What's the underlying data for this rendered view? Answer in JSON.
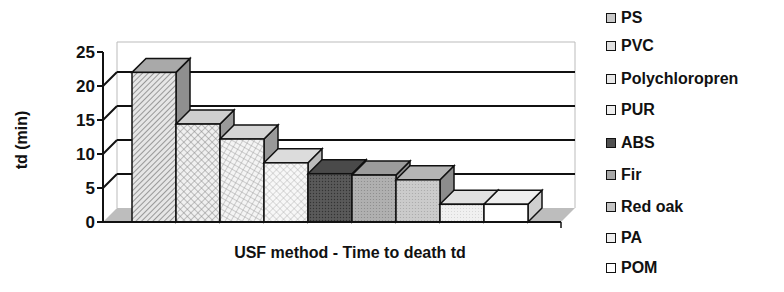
{
  "chart_data": {
    "type": "bar",
    "style": "3d-column",
    "title": "",
    "xlabel": "USF method - Time to death td",
    "ylabel": "td (min)",
    "ylim": [
      0,
      25
    ],
    "yticks": [
      0,
      5,
      10,
      15,
      20,
      25
    ],
    "grid": true,
    "legend_position": "right",
    "categories": [
      "PS",
      "PVC",
      "Polychloropren",
      "PUR",
      "ABS",
      "Fir",
      "Red oak",
      "PA",
      "POM"
    ],
    "values": [
      22,
      14.4,
      12.2,
      8.7,
      7.1,
      6.9,
      6.2,
      2.6,
      2.6
    ],
    "series": [
      {
        "name": "PS",
        "value": 22,
        "fill": "#c8c8c8",
        "pattern": "diag"
      },
      {
        "name": "PVC",
        "value": 14.4,
        "fill": "#e4e4e4",
        "pattern": "cross"
      },
      {
        "name": "Polychloropren",
        "value": 12.2,
        "fill": "#ececec",
        "pattern": "cross"
      },
      {
        "name": "PUR",
        "value": 8.7,
        "fill": "#f2f2f2",
        "pattern": "diag-light"
      },
      {
        "name": "ABS",
        "value": 7.1,
        "fill": "#505050",
        "pattern": "dots"
      },
      {
        "name": "Fir",
        "value": 6.9,
        "fill": "#a8a8a8",
        "pattern": "dots"
      },
      {
        "name": "Red oak",
        "value": 6.2,
        "fill": "#c4c4c4",
        "pattern": "dots"
      },
      {
        "name": "PA",
        "value": 2.6,
        "fill": "#eeeeee",
        "pattern": "dots"
      },
      {
        "name": "POM",
        "value": 2.6,
        "fill": "#ffffff",
        "pattern": "none"
      }
    ]
  },
  "axis": {
    "y_title": "td (min)",
    "x_title": "USF method - Time to death td"
  },
  "legend": {
    "items": [
      "PS",
      "PVC",
      "Polychloropren",
      "PUR",
      "ABS",
      "Fir",
      "Red oak",
      "PA",
      "POM"
    ]
  }
}
